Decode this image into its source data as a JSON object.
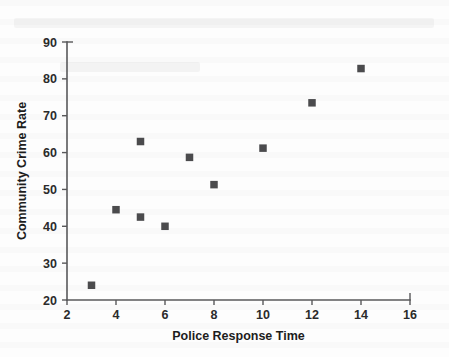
{
  "chart_data": {
    "type": "scatter",
    "title": "",
    "xlabel": "Police Response Time",
    "ylabel": "Community Crime Rate",
    "xlim": [
      2,
      16
    ],
    "ylim": [
      20,
      90
    ],
    "xticks": [
      2,
      4,
      6,
      8,
      10,
      12,
      14,
      16
    ],
    "yticks": [
      20,
      30,
      40,
      50,
      60,
      70,
      80,
      90
    ],
    "xtick_labels": [
      "2",
      "4",
      "6",
      "8",
      "10",
      "12",
      "14",
      "16"
    ],
    "ytick_labels": [
      "20",
      "30",
      "40",
      "50",
      "60",
      "70",
      "80",
      "90"
    ],
    "grid": false,
    "legend": null,
    "marker": "square",
    "marker_color": "#4b4b4d",
    "series": [
      {
        "name": "observations",
        "points": [
          {
            "x": 3,
            "y": 24.0
          },
          {
            "x": 4,
            "y": 44.5
          },
          {
            "x": 5,
            "y": 63.0
          },
          {
            "x": 5,
            "y": 42.5
          },
          {
            "x": 6,
            "y": 40.0
          },
          {
            "x": 7,
            "y": 58.7
          },
          {
            "x": 8,
            "y": 51.3
          },
          {
            "x": 10,
            "y": 61.2
          },
          {
            "x": 12,
            "y": 73.5
          },
          {
            "x": 14,
            "y": 82.8
          }
        ]
      }
    ]
  },
  "axes": {
    "x_title": "Police Response Time",
    "y_title": "Community Crime Rate"
  }
}
